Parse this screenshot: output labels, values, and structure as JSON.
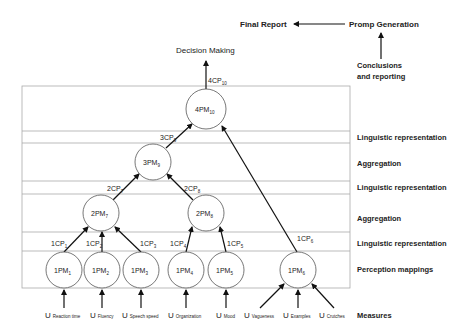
{
  "header": {
    "final_report": "Final Report",
    "promp_generation": "Promp Generation",
    "conclusions_line1": "Conclusions",
    "conclusions_line2": "and reporting",
    "decision_making": "Decision Making"
  },
  "layers": {
    "linguistic_1": "Linguistic  representation",
    "aggregation_1": "Aggregation",
    "linguistic_2": "Linguistic  representation",
    "aggregation_2": "Aggregation",
    "linguistic_3": "Linguistic  representation",
    "perception": "Perception  mappings",
    "measures": "Measures"
  },
  "nodes": {
    "pm10": {
      "main": "4PM",
      "sub": "10"
    },
    "pm9": {
      "main": "3PM",
      "sub": "9"
    },
    "pm7": {
      "main": "2PM",
      "sub": "7"
    },
    "pm8": {
      "main": "2PM",
      "sub": "8"
    },
    "pm1": {
      "main": "1PM",
      "sub": "1"
    },
    "pm2": {
      "main": "1PM",
      "sub": "2"
    },
    "pm3": {
      "main": "1PM",
      "sub": "3"
    },
    "pm4": {
      "main": "1PM",
      "sub": "4"
    },
    "pm5": {
      "main": "1PM",
      "sub": "5"
    },
    "pm6": {
      "main": "1PM",
      "sub": "6"
    }
  },
  "edges": {
    "cp10": {
      "main": "4CP",
      "sub": "10"
    },
    "cp9": {
      "main": "3CP",
      "sub": "9"
    },
    "cp7": {
      "main": "2CP",
      "sub": "7"
    },
    "cp8": {
      "main": "2CP",
      "sub": "8"
    },
    "cp1": {
      "main": "1CP",
      "sub": "1"
    },
    "cp2": {
      "main": "1CP",
      "sub": "2"
    },
    "cp3": {
      "main": "1CP",
      "sub": "3"
    },
    "cp4": {
      "main": "1CP",
      "sub": "4"
    },
    "cp5": {
      "main": "1CP",
      "sub": "5"
    },
    "cp6": {
      "main": "1CP",
      "sub": "6"
    }
  },
  "measures": {
    "m1": {
      "u": "U",
      "name": "Reaction time"
    },
    "m2": {
      "u": "U",
      "name": "Fluency"
    },
    "m3": {
      "u": "U",
      "name": "Speech speed"
    },
    "m4": {
      "u": "U",
      "name": "Organization"
    },
    "m5": {
      "u": "U",
      "name": "Mood"
    },
    "m6": {
      "u": "U",
      "name": "Vagueness"
    },
    "m7": {
      "u": "U",
      "name": "Examples"
    },
    "m8": {
      "u": "U",
      "name": "Crutches"
    }
  }
}
